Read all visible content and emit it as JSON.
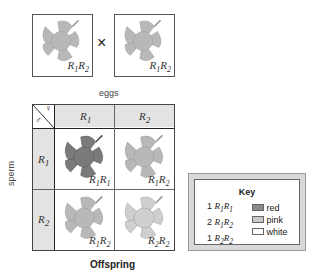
{
  "parents": [
    {
      "genotype_a": "R",
      "sub_a": "1",
      "genotype_b": "R",
      "sub_b": "2",
      "flower_color": "#b8b8b8"
    },
    {
      "genotype_a": "R",
      "sub_a": "1",
      "genotype_b": "R",
      "sub_b": "2",
      "flower_color": "#b8b8b8"
    }
  ],
  "cross_symbol": "×",
  "labels": {
    "eggs": "eggs",
    "sperm": "sperm",
    "offspring": "Offspring"
  },
  "grid": {
    "corner_female": "♀",
    "corner_male": "♂",
    "col_headers": [
      {
        "a": "R",
        "sub": "1"
      },
      {
        "a": "R",
        "sub": "2"
      }
    ],
    "row_headers": [
      {
        "a": "R",
        "sub": "1"
      },
      {
        "a": "R",
        "sub": "2"
      }
    ],
    "cells": [
      [
        {
          "a": "R",
          "s1": "1",
          "b": "R",
          "s2": "1",
          "color": "#7a7a7a"
        },
        {
          "a": "R",
          "s1": "1",
          "b": "R",
          "s2": "2",
          "color": "#b8b8b8"
        }
      ],
      [
        {
          "a": "R",
          "s1": "1",
          "b": "R",
          "s2": "2",
          "color": "#b8b8b8"
        },
        {
          "a": "R",
          "s1": "2",
          "b": "R",
          "s2": "2",
          "color": "#cfcfcf"
        }
      ]
    ]
  },
  "key": {
    "title": "Key",
    "items": [
      {
        "count": "1",
        "a": "R",
        "s1": "1",
        "b": "R",
        "s2": "1",
        "label": "red",
        "swatch": "#8a8a8a"
      },
      {
        "count": "2",
        "a": "R",
        "s1": "1",
        "b": "R",
        "s2": "2",
        "label": "pink",
        "swatch": "#c8c8c8"
      },
      {
        "count": "1",
        "a": "R",
        "s1": "2",
        "b": "R",
        "s2": "2",
        "label": "white",
        "swatch": "#ffffff"
      }
    ]
  }
}
